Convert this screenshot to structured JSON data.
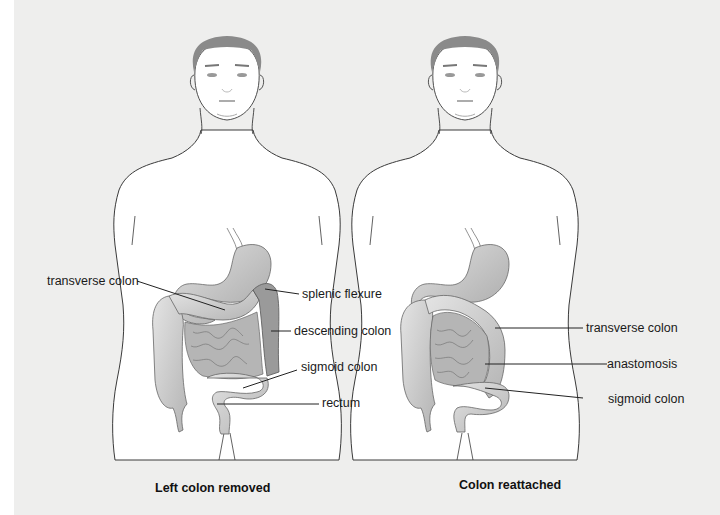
{
  "panels": [
    {
      "id": "left",
      "caption": "Left colon removed",
      "labels": {
        "transverse_colon": "transverse colon",
        "splenic_flexure": "splenic flexure",
        "descending_colon": "descending colon",
        "sigmoid_colon": "sigmoid colon",
        "rectum": "rectum"
      }
    },
    {
      "id": "right",
      "caption": "Colon reattached",
      "labels": {
        "transverse_colon": "transverse colon",
        "anastomosis": "anastomosis",
        "sigmoid_colon": "sigmoid colon"
      }
    }
  ],
  "colors": {
    "background": "#eeeeed",
    "body": "#ffffff",
    "outline": "#3a3a3a",
    "hair": "#8a8a8a",
    "organ_fill": "#c8c8c8",
    "removed_colon": "#9a9a9a",
    "small_intestine": "#b5b5b5"
  }
}
